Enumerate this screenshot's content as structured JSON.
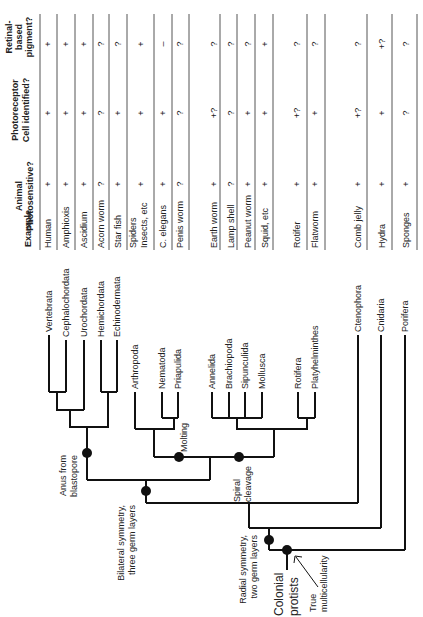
{
  "table": {
    "headers": {
      "example": "Example",
      "photosensitive": [
        "Animal",
        "Photosensitive?"
      ],
      "photoreceptor": [
        "Photoreceptor",
        "Cell identified?"
      ],
      "retinal": [
        "Retinal-",
        "based",
        "pigment?"
      ]
    },
    "rows": [
      {
        "x": 48,
        "example": [
          "Human"
        ],
        "photo": "+",
        "cell": "+",
        "pig": "+"
      },
      {
        "x": 66,
        "example": [
          "Amphioxis"
        ],
        "photo": "+",
        "cell": "+",
        "pig": "+"
      },
      {
        "x": 84,
        "example": [
          "Ascidium"
        ],
        "photo": "+",
        "cell": "+",
        "pig": "+"
      },
      {
        "x": 101,
        "example": [
          "Acorn worm"
        ],
        "photo": "?",
        "cell": "?",
        "pig": "?"
      },
      {
        "x": 118,
        "example": [
          "Star fish"
        ],
        "photo": "+",
        "cell": "+",
        "pig": "?"
      },
      {
        "x": 141,
        "example": [
          "Spiders",
          "Insects, etc"
        ],
        "photo": "+",
        "cell": "+",
        "pig": "+"
      },
      {
        "x": 163,
        "example": [
          "C. elegans"
        ],
        "photo": "+",
        "cell": "+",
        "pig": "–"
      },
      {
        "x": 180,
        "example": [
          "Penis worm"
        ],
        "photo": "?",
        "cell": "?",
        "pig": "?"
      },
      {
        "x": 214,
        "example": [
          "Earth worm"
        ],
        "photo": "+",
        "cell": "+?",
        "pig": "?"
      },
      {
        "x": 231,
        "example": [
          "Lamp shell"
        ],
        "photo": "?",
        "cell": "?",
        "pig": "?"
      },
      {
        "x": 248,
        "example": [
          "Peanut worm"
        ],
        "photo": "+",
        "cell": "+",
        "pig": "?"
      },
      {
        "x": 265,
        "example": [
          "Squid, etc"
        ],
        "photo": "+",
        "cell": "+",
        "pig": "+"
      },
      {
        "x": 297,
        "example": [
          "Rotifer"
        ],
        "photo": "+",
        "cell": "+?",
        "pig": "?"
      },
      {
        "x": 315,
        "example": [
          "Flatworm"
        ],
        "photo": "+",
        "cell": "+",
        "pig": "?"
      },
      {
        "x": 358,
        "example": [
          "Comb jelly"
        ],
        "photo": "+",
        "cell": "+?",
        "pig": "?"
      },
      {
        "x": 382,
        "example": [
          "Hydra"
        ],
        "photo": "+",
        "cell": "+",
        "pig": "+?"
      },
      {
        "x": 406,
        "example": [
          "Sponges"
        ],
        "photo": "+",
        "cell": "?",
        "pig": "?"
      }
    ],
    "separators": [
      40,
      57,
      75,
      93,
      109,
      127,
      154,
      172,
      189,
      220,
      237,
      255,
      273,
      307,
      325,
      367,
      392,
      417
    ]
  },
  "taxa": [
    {
      "name": "Vertebrata",
      "x": 49,
      "top": 335,
      "bottom": 392
    },
    {
      "name": "Cephalochordata",
      "x": 66,
      "top": 340,
      "bottom": 392
    },
    {
      "name": "Urochordata",
      "x": 84,
      "top": 340,
      "bottom": 410
    },
    {
      "name": "Hemichordata",
      "x": 101,
      "top": 340,
      "bottom": 392
    },
    {
      "name": "Echinodermata",
      "x": 117,
      "top": 340,
      "bottom": 392
    },
    {
      "name": "Arthropoda",
      "x": 135,
      "top": 392,
      "bottom": 429
    },
    {
      "name": "Nematoda",
      "x": 162,
      "top": 392,
      "bottom": 418
    },
    {
      "name": "Priapulida",
      "x": 178,
      "top": 392,
      "bottom": 418
    },
    {
      "name": "Annelida",
      "x": 212,
      "top": 392,
      "bottom": 418
    },
    {
      "name": "Brachiopoda",
      "x": 229,
      "top": 392,
      "bottom": 418
    },
    {
      "name": "Sipunculida",
      "x": 245,
      "top": 392,
      "bottom": 418
    },
    {
      "name": "Mollusca",
      "x": 262,
      "top": 392,
      "bottom": 418
    },
    {
      "name": "Rotifera",
      "x": 298,
      "top": 392,
      "bottom": 418
    },
    {
      "name": "Platyhelminthes",
      "x": 315,
      "top": 392,
      "bottom": 418
    },
    {
      "name": "Ctenophora",
      "x": 358,
      "top": 335,
      "bottom": 503
    },
    {
      "name": "Cnidaria",
      "x": 381,
      "top": 335,
      "bottom": 528
    },
    {
      "name": "Porifera",
      "x": 405,
      "top": 335,
      "bottom": 550
    }
  ],
  "nodes": {
    "anus_from_blastopore": {
      "label": [
        "Anus from",
        "blastopore"
      ]
    },
    "molting": {
      "label": [
        "Molting"
      ]
    },
    "spiral_cleavage": {
      "label": [
        "Spiral",
        "cleavage"
      ]
    },
    "bilateral_symmetry": {
      "label": [
        "Bilateral symmetry,",
        "three germ layers"
      ]
    },
    "radial_symmetry": {
      "label": [
        "Radial symmetry,",
        "two germ layers"
      ]
    },
    "colonial_protists": {
      "label": [
        "Colonial",
        "protists"
      ]
    },
    "true_multicellularity": {
      "label": [
        "True",
        "multicellularity"
      ]
    }
  }
}
